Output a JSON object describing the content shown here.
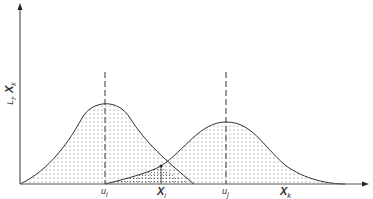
{
  "diagram": {
    "y_axis_label": {
      "prefix": "L",
      "sub1": "i",
      "sep": ", ",
      "main": "X",
      "sub2": "k"
    },
    "labels": {
      "u_i": {
        "main": "u",
        "sub": "i"
      },
      "X_i": {
        "main": "X",
        "sub": "i"
      },
      "u_j": {
        "main": "u",
        "sub": "j"
      },
      "X_k": {
        "main": "X",
        "sub": "k"
      }
    },
    "colors": {
      "line": "#333333",
      "axis": "#555555",
      "dot": "#555555"
    }
  }
}
